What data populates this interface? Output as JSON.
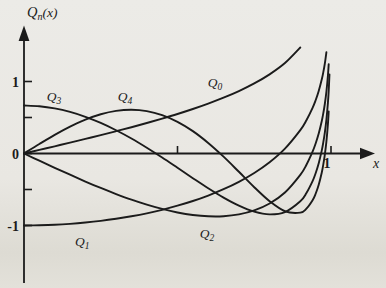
{
  "figure": {
    "background": "#e9e7e2",
    "ink": "#1b1b1b"
  },
  "chart_data": {
    "type": "line",
    "ylabel": {
      "base": "Q",
      "sub": "n",
      "rest": "(x)"
    },
    "xlabel": "x",
    "xlim": [
      0,
      1.15
    ],
    "ylim": [
      -1.8,
      1.75
    ],
    "grid": false,
    "legend": "inline-curve-labels",
    "x_ticks": [
      {
        "value": 0.5,
        "label": ""
      },
      {
        "value": 1.0,
        "label": "1"
      }
    ],
    "y_ticks": [
      {
        "value": 1.0,
        "label": "1"
      },
      {
        "value": 0.5,
        "label": ""
      },
      {
        "value": 0.0,
        "label": "0"
      },
      {
        "value": -0.5,
        "label": ""
      },
      {
        "value": -1.0,
        "label": "-1"
      }
    ],
    "series": [
      {
        "name": "Q0",
        "label_base": "Q",
        "label_sub": "0",
        "label_at": [
          0.622,
          0.986
        ],
        "points": [
          [
            0,
            0
          ],
          [
            0.05,
            0.05
          ],
          [
            0.1,
            0.1
          ],
          [
            0.15,
            0.151
          ],
          [
            0.2,
            0.203
          ],
          [
            0.25,
            0.255
          ],
          [
            0.3,
            0.31
          ],
          [
            0.35,
            0.365
          ],
          [
            0.4,
            0.424
          ],
          [
            0.45,
            0.485
          ],
          [
            0.5,
            0.549
          ],
          [
            0.55,
            0.618
          ],
          [
            0.6,
            0.693
          ],
          [
            0.65,
            0.775
          ],
          [
            0.7,
            0.867
          ],
          [
            0.75,
            0.973
          ],
          [
            0.8,
            1.099
          ],
          [
            0.85,
            1.256
          ],
          [
            0.9,
            1.472
          ]
        ]
      },
      {
        "name": "Q1",
        "label_base": "Q",
        "label_sub": "1",
        "label_at": [
          0.19,
          -1.22
        ],
        "points": [
          [
            0,
            -1
          ],
          [
            0.05,
            -0.997
          ],
          [
            0.1,
            -0.99
          ],
          [
            0.15,
            -0.977
          ],
          [
            0.2,
            -0.959
          ],
          [
            0.25,
            -0.936
          ],
          [
            0.3,
            -0.907
          ],
          [
            0.35,
            -0.872
          ],
          [
            0.4,
            -0.831
          ],
          [
            0.45,
            -0.782
          ],
          [
            0.5,
            -0.725
          ],
          [
            0.55,
            -0.66
          ],
          [
            0.6,
            -0.584
          ],
          [
            0.65,
            -0.496
          ],
          [
            0.7,
            -0.393
          ],
          [
            0.75,
            -0.27
          ],
          [
            0.8,
            -0.121
          ],
          [
            0.85,
            0.068
          ],
          [
            0.9,
            0.325
          ],
          [
            0.92,
            0.462
          ],
          [
            0.94,
            0.634
          ],
          [
            0.95,
            0.74
          ],
          [
            0.96,
            0.868
          ],
          [
            0.97,
            1.03
          ],
          [
            0.975,
            1.13
          ],
          [
            0.98,
            1.252
          ],
          [
            0.985,
            1.406
          ]
        ]
      },
      {
        "name": "Q2",
        "label_base": "Q",
        "label_sub": "2",
        "label_at": [
          0.596,
          -1.11
        ],
        "points": [
          [
            0,
            0
          ],
          [
            0.05,
            -0.1
          ],
          [
            0.1,
            -0.199
          ],
          [
            0.15,
            -0.295
          ],
          [
            0.2,
            -0.389
          ],
          [
            0.25,
            -0.479
          ],
          [
            0.3,
            -0.563
          ],
          [
            0.35,
            -0.641
          ],
          [
            0.4,
            -0.71
          ],
          [
            0.45,
            -0.77
          ],
          [
            0.5,
            -0.819
          ],
          [
            0.55,
            -0.854
          ],
          [
            0.6,
            -0.872
          ],
          [
            0.65,
            -0.871
          ],
          [
            0.7,
            -0.846
          ],
          [
            0.75,
            -0.791
          ],
          [
            0.8,
            -0.695
          ],
          [
            0.85,
            -0.542
          ],
          [
            0.9,
            -0.297
          ],
          [
            0.92,
            -0.157
          ],
          [
            0.94,
            0.025
          ],
          [
            0.95,
            0.139
          ],
          [
            0.96,
            0.277
          ],
          [
            0.97,
            0.452
          ],
          [
            0.975,
            0.56
          ],
          [
            0.98,
            0.691
          ],
          [
            0.985,
            0.856
          ],
          [
            0.99,
            1.083
          ],
          [
            0.9925,
            1.24
          ]
        ]
      },
      {
        "name": "Q3",
        "label_base": "Q",
        "label_sub": "3",
        "label_at": [
          0.098,
          0.792
        ],
        "points": [
          [
            0,
            0.667
          ],
          [
            0.05,
            0.657
          ],
          [
            0.1,
            0.627
          ],
          [
            0.15,
            0.578
          ],
          [
            0.2,
            0.51
          ],
          [
            0.25,
            0.425
          ],
          [
            0.3,
            0.323
          ],
          [
            0.35,
            0.208
          ],
          [
            0.4,
            0.08
          ],
          [
            0.45,
            -0.056
          ],
          [
            0.5,
            -0.199
          ],
          [
            0.55,
            -0.343
          ],
          [
            0.6,
            -0.483
          ],
          [
            0.65,
            -0.613
          ],
          [
            0.7,
            -0.725
          ],
          [
            0.75,
            -0.808
          ],
          [
            0.8,
            -0.845
          ],
          [
            0.85,
            -0.813
          ],
          [
            0.9,
            -0.663
          ],
          [
            0.92,
            -0.549
          ],
          [
            0.94,
            -0.384
          ],
          [
            0.95,
            -0.274
          ],
          [
            0.96,
            -0.135
          ],
          [
            0.97,
            0.044
          ],
          [
            0.975,
            0.157
          ],
          [
            0.98,
            0.294
          ],
          [
            0.985,
            0.468
          ],
          [
            0.99,
            0.706
          ],
          [
            0.9925,
            0.871
          ],
          [
            0.995,
            1.097
          ]
        ]
      },
      {
        "name": "Q4",
        "label_base": "Q",
        "label_sub": "4",
        "label_at": [
          0.329,
          0.792
        ],
        "points": [
          [
            0,
            0
          ],
          [
            0.05,
            0.132
          ],
          [
            0.1,
            0.259
          ],
          [
            0.15,
            0.373
          ],
          [
            0.2,
            0.47
          ],
          [
            0.25,
            0.545
          ],
          [
            0.3,
            0.592
          ],
          [
            0.35,
            0.608
          ],
          [
            0.4,
            0.589
          ],
          [
            0.45,
            0.533
          ],
          [
            0.5,
            0.44
          ],
          [
            0.55,
            0.311
          ],
          [
            0.6,
            0.147
          ],
          [
            0.65,
            -0.044
          ],
          [
            0.7,
            -0.254
          ],
          [
            0.75,
            -0.468
          ],
          [
            0.8,
            -0.663
          ],
          [
            0.85,
            -0.802
          ],
          [
            0.9,
            -0.821
          ],
          [
            0.92,
            -0.766
          ],
          [
            0.94,
            -0.65
          ],
          [
            0.95,
            -0.559
          ],
          [
            0.96,
            -0.435
          ],
          [
            0.97,
            -0.264
          ],
          [
            0.975,
            -0.152
          ],
          [
            0.98,
            -0.013
          ],
          [
            0.985,
            0.164
          ],
          [
            0.99,
            0.412
          ],
          [
            0.9925,
            0.583
          ]
        ]
      }
    ]
  }
}
